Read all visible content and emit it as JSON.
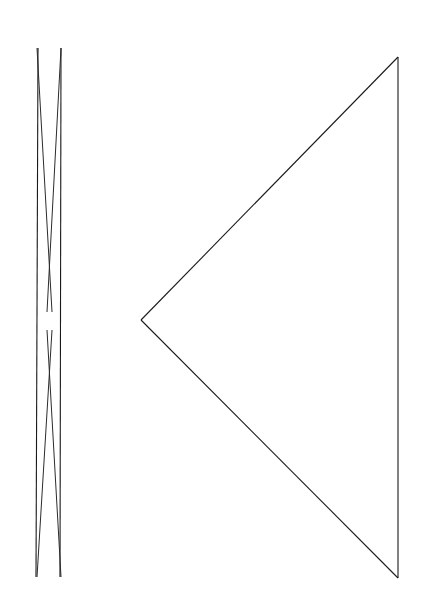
{
  "canvas": {
    "width": 427,
    "height": 613,
    "background_color": "#ffffff",
    "title": "Line Drawing: Elongated Bowtie and Leftward Triangle"
  },
  "style": {
    "stroke_color": "#1a1a1a",
    "stroke_color_soft": "#2b2b2b",
    "stroke_width": 1.1,
    "stroke_width_thin": 1.0
  },
  "shapes": {
    "bowtie": {
      "name": "elongated-bowtie",
      "description": "Very narrow vertical hourglass formed by two near-vertical outer lines and two long crossing diagonals meeting near the vertical center.",
      "top_left_tip": [
        37,
        48
      ],
      "top_right_tip": [
        61,
        48
      ],
      "bottom_left_tip": [
        37,
        577
      ],
      "bottom_right_tip": [
        61,
        577
      ],
      "crossing_center": [
        49,
        320
      ],
      "gap_top": [
        49,
        312
      ],
      "gap_bottom": [
        49,
        330
      ],
      "outer_left_line": [
        [
          38,
          48
        ],
        [
          36,
          577
        ]
      ],
      "outer_right_line": [
        [
          61,
          48
        ],
        [
          60,
          577
        ]
      ],
      "diagonal_down_right": [
        [
          37,
          48
        ],
        [
          52,
          312
        ]
      ],
      "diagonal_down_right_2": [
        [
          47,
          330
        ],
        [
          61,
          577
        ]
      ],
      "diagonal_down_left": [
        [
          61,
          48
        ],
        [
          47,
          312
        ]
      ],
      "diagonal_down_left_2": [
        [
          52,
          330
        ],
        [
          37,
          577
        ]
      ]
    },
    "triangle": {
      "name": "leftward-pointing-triangle",
      "description": "Large triangle pointing left; vertical right edge with apex at mid-left.",
      "apex": [
        141,
        320
      ],
      "top_right": [
        398,
        57
      ],
      "bottom_right": [
        398,
        578
      ],
      "edges": [
        {
          "name": "upper-diagonal-edge",
          "from": [
            141,
            320
          ],
          "to": [
            398,
            57
          ]
        },
        {
          "name": "right-vertical-edge",
          "from": [
            398,
            57
          ],
          "to": [
            398,
            578
          ]
        },
        {
          "name": "lower-diagonal-edge",
          "from": [
            398,
            578
          ],
          "to": [
            141,
            320
          ]
        }
      ]
    }
  }
}
